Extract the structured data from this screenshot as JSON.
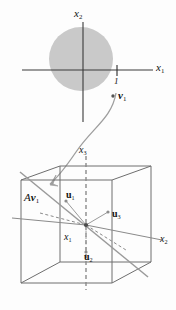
{
  "figure": {
    "colors": {
      "disk_fill": "#c9c9c9",
      "axis": "#3a3a3a",
      "cube_edge": "#6e6e6e",
      "dashed_axis": "#8a8a8a",
      "curve": "#9a9a9a",
      "text": "#111111",
      "background": "#fdfdfd"
    },
    "top_panel": {
      "name": "unit-disk-plane",
      "axes": [
        {
          "name": "x1-axis",
          "label": "x",
          "subscript": "1",
          "orientation": "horizontal"
        },
        {
          "name": "x2-axis",
          "label": "x",
          "subscript": "2",
          "orientation": "vertical"
        }
      ],
      "tick": {
        "name": "unit-tick",
        "label": "1",
        "axis": "x1",
        "value": 1
      },
      "disk": {
        "name": "unit-disk",
        "center": [
          0,
          0
        ],
        "radius": 1,
        "shaded": true
      },
      "point": {
        "name": "v1-point",
        "label": "v",
        "subscript": "1",
        "style": "bold-italic-vector"
      }
    },
    "connector": {
      "name": "transformation-arrow",
      "description": "curved arrow from v1 to Av1",
      "arrowhead": true
    },
    "bottom_panel": {
      "name": "r3-cube",
      "axes": [
        {
          "name": "x1-axis-3d",
          "label": "x",
          "subscript": "1"
        },
        {
          "name": "x2-axis-3d",
          "label": "x",
          "subscript": "2"
        },
        {
          "name": "x3-axis-3d",
          "label": "x",
          "subscript": "3"
        }
      ],
      "image_vector": {
        "name": "Av1-vector",
        "operator": "A",
        "label": "v",
        "subscript": "1"
      },
      "basis_vectors": [
        {
          "name": "u1-vector",
          "label": "u",
          "subscript": "1"
        },
        {
          "name": "u2-vector",
          "label": "u",
          "subscript": "2"
        },
        {
          "name": "u3-vector",
          "label": "u",
          "subscript": "3"
        }
      ]
    }
  }
}
